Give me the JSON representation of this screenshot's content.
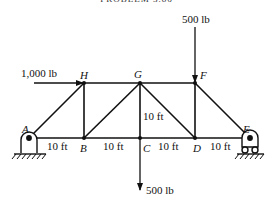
{
  "title": "PROBLEM 3.86",
  "nodes": {
    "A": "A",
    "B": "B",
    "C": "C",
    "D": "D",
    "E": "E",
    "F": "F",
    "G": "G",
    "H": "H"
  },
  "loads": {
    "horizontal_H": "1,000 lb",
    "vertical_F": "500 lb",
    "vertical_C": "500 lb"
  },
  "dimensions": {
    "AB": "10 ft",
    "BC": "10 ft",
    "CD": "10 ft",
    "DE": "10 ft",
    "height": "10 ft"
  },
  "supports": {
    "A": "pin-support",
    "E": "roller-support"
  }
}
